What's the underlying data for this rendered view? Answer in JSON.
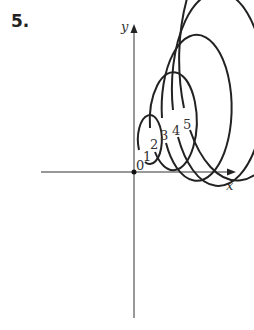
{
  "problem": {
    "number": "5."
  },
  "axes": {
    "x_label": "x",
    "y_label": "y"
  },
  "contours": {
    "labels": [
      "0",
      "1",
      "2",
      "3",
      "4",
      "5"
    ],
    "levels": [
      0,
      1,
      2,
      3,
      4,
      5
    ],
    "shape": "concentric ellipses, vertical major axis (ratio ~2:1)"
  },
  "colors": {
    "stroke": "#222222",
    "text": "#333333"
  }
}
